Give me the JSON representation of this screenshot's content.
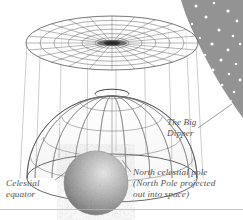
{
  "figure": {
    "background_color": "#ffffff",
    "sky_color": "#878787",
    "ink_color": "#4a4a4a",
    "label_color": "#555150",
    "globe_color": "#9a9a9a"
  },
  "labels": {
    "big_dipper": {
      "line1": "The Big",
      "line2": "Dipper"
    },
    "celestial_equator": {
      "line1": "Celestial",
      "line2": "equator"
    },
    "north_celestial_pole": {
      "line1": "North celestial pole",
      "line2": "(North Pole projected",
      "line3": "out into space)"
    }
  },
  "elements": {
    "sky_wedge": "night-sky-wedge",
    "stars": "star-field",
    "disk": "celestial-pole-disk",
    "dome": "celestial-hemisphere",
    "globe": "earth-globe",
    "projection_lines": "projection-cylinder",
    "footer_rule": "page-rule"
  },
  "star_field": {
    "count": 21,
    "points": [
      [
        196,
        6,
        1.5
      ],
      [
        214,
        3,
        1.3
      ],
      [
        228,
        11,
        1.6
      ],
      [
        206,
        17,
        1.5
      ],
      [
        237,
        21,
        1.4
      ],
      [
        192,
        24,
        1.2
      ],
      [
        219,
        30,
        1.5
      ],
      [
        233,
        36,
        1.3
      ],
      [
        200,
        38,
        1.1
      ],
      [
        212,
        44,
        1.6
      ],
      [
        228,
        50,
        1.4
      ],
      [
        240,
        44,
        1.2
      ],
      [
        205,
        55,
        1.3
      ],
      [
        221,
        60,
        1.5
      ],
      [
        236,
        64,
        1.3
      ],
      [
        213,
        70,
        1.4
      ],
      [
        229,
        74,
        1.2
      ],
      [
        240,
        80,
        1.4
      ],
      [
        222,
        85,
        1.3
      ],
      [
        234,
        92,
        1.2
      ],
      [
        231,
        101,
        1.1
      ]
    ]
  }
}
